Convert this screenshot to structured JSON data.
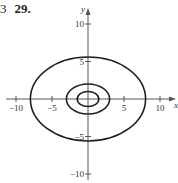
{
  "problem": {
    "prefix": "3",
    "number": "29."
  },
  "chart_data": {
    "type": "line",
    "title": "",
    "xlabel": "x",
    "ylabel": "y",
    "xlim": [
      -11,
      12
    ],
    "ylim": [
      -11,
      12
    ],
    "grid": false,
    "x_ticks": [
      -10,
      -5,
      5,
      10
    ],
    "y_ticks": [
      -10,
      -5,
      5,
      10
    ],
    "x_tick_labels": [
      "−10",
      "−5",
      "5",
      "10"
    ],
    "y_tick_labels": [
      "−10",
      "−5",
      "5",
      "10"
    ],
    "series": [
      {
        "name": "inner ellipse",
        "shape": "ellipse",
        "cx": 0,
        "cy": 0,
        "rx": 1.5,
        "ry": 1
      },
      {
        "name": "middle ellipse",
        "shape": "ellipse",
        "cx": 0,
        "cy": 0,
        "rx": 3,
        "ry": 2
      },
      {
        "name": "outer ellipse",
        "shape": "ellipse",
        "cx": 0,
        "cy": 0,
        "rx": 8,
        "ry": 5.6
      }
    ],
    "colors": {
      "curve": "#222222",
      "axis": "#555555"
    }
  }
}
